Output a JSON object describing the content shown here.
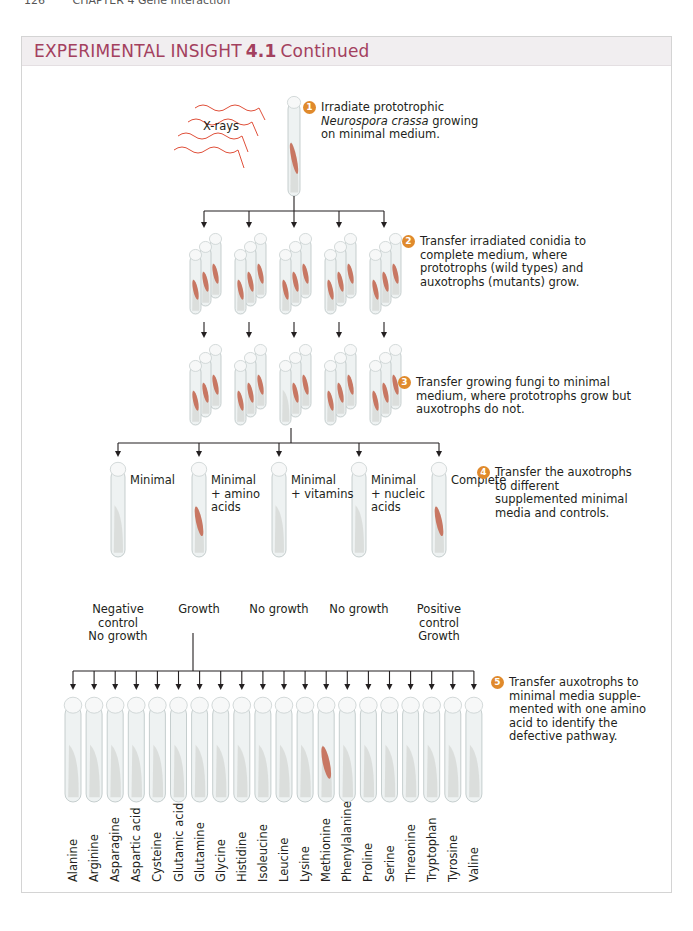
{
  "running_head": {
    "page": "126",
    "chapter": "CHAPTER 4 Gene Interaction"
  },
  "box": {
    "title_prefix": "EXPERIMENTAL INSIGHT",
    "number": "4.1",
    "suffix": "Continued"
  },
  "colors": {
    "title": "#a3405e",
    "header_bg": "#f1eef0",
    "step_circle": "#e08a2c",
    "growth": "#c4654e",
    "xray": "#e0503a"
  },
  "xray_label": "X-rays",
  "steps": [
    {
      "n": "1",
      "lines": [
        "Irradiate prototrophic",
        "Neurospora crassa growing",
        "on minimal medium."
      ]
    },
    {
      "n": "2",
      "lines": [
        "Transfer irradiated conidia to",
        "complete medium, where",
        "prototrophs (wild types) and",
        "auxotrophs (mutants) grow."
      ]
    },
    {
      "n": "3",
      "lines": [
        "Transfer growing fungi to minimal",
        "medium, where prototrophs grow but",
        "auxotrophs do not."
      ]
    },
    {
      "n": "4",
      "lines": [
        "Transfer the auxotrophs",
        "to different",
        "supplemented minimal",
        "media and controls."
      ]
    },
    {
      "n": "5",
      "lines": [
        "Transfer auxotrophs to",
        "minimal media supple-",
        "mented with one amino",
        "acid to identify the",
        "defective pathway."
      ]
    }
  ],
  "media": [
    {
      "label": [
        "Minimal"
      ],
      "result": [
        "Negative",
        "control",
        "No growth"
      ],
      "growth": false
    },
    {
      "label": [
        "Minimal",
        "+ amino",
        "acids"
      ],
      "result": [
        "Growth"
      ],
      "growth": true
    },
    {
      "label": [
        "Minimal",
        "+ vitamins"
      ],
      "result": [
        "No growth"
      ],
      "growth": false
    },
    {
      "label": [
        "Minimal",
        "+ nucleic",
        "acids"
      ],
      "result": [
        "No growth"
      ],
      "growth": false
    },
    {
      "label": [
        "Complete"
      ],
      "result": [
        "Positive",
        "control",
        "Growth"
      ],
      "growth": true
    }
  ],
  "amino_acids": [
    "Alanine",
    "Arginine",
    "Asparagine",
    "Aspartic acid",
    "Cysteine",
    "Glutamic acid",
    "Glutamine",
    "Glycine",
    "Histidine",
    "Isoleucine",
    "Leucine",
    "Lysine",
    "Methionine",
    "Phenylalanine",
    "Proline",
    "Serine",
    "Threonine",
    "Tryptophan",
    "Tyrosine",
    "Valine"
  ],
  "amino_growth_index": 12
}
